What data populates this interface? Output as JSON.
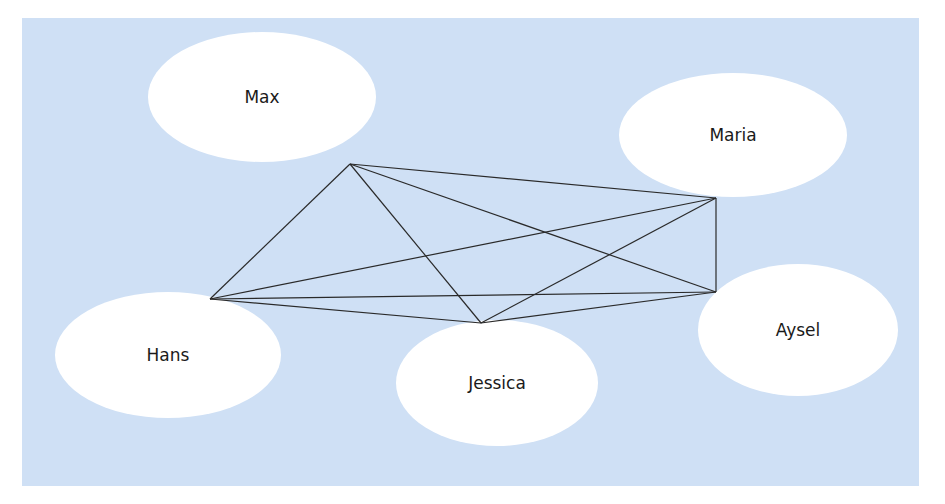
{
  "diagram": {
    "type": "complete-graph",
    "background_color": "#cfe0f5",
    "node_color": "#ffffff",
    "edge_color": "#2a2a2a",
    "nodes": [
      {
        "id": "max",
        "label": "Max",
        "cx": 262,
        "cy": 97,
        "rx": 114,
        "ry": 65,
        "anchor": [
          350,
          164
        ]
      },
      {
        "id": "maria",
        "label": "Maria",
        "cx": 733,
        "cy": 135,
        "rx": 114,
        "ry": 62,
        "anchor": [
          716,
          198
        ]
      },
      {
        "id": "hans",
        "label": "Hans",
        "cx": 168,
        "cy": 355,
        "rx": 113,
        "ry": 63,
        "anchor": [
          210,
          299
        ]
      },
      {
        "id": "jessica",
        "label": "Jessica",
        "cx": 497,
        "cy": 383,
        "rx": 101,
        "ry": 63,
        "anchor": [
          481,
          323
        ]
      },
      {
        "id": "aysel",
        "label": "Aysel",
        "cx": 798,
        "cy": 330,
        "rx": 100,
        "ry": 66,
        "anchor": [
          716,
          292
        ]
      }
    ],
    "edges": [
      [
        "max",
        "maria"
      ],
      [
        "max",
        "hans"
      ],
      [
        "max",
        "jessica"
      ],
      [
        "max",
        "aysel"
      ],
      [
        "maria",
        "hans"
      ],
      [
        "maria",
        "jessica"
      ],
      [
        "maria",
        "aysel"
      ],
      [
        "hans",
        "jessica"
      ],
      [
        "hans",
        "aysel"
      ],
      [
        "jessica",
        "aysel"
      ]
    ]
  }
}
